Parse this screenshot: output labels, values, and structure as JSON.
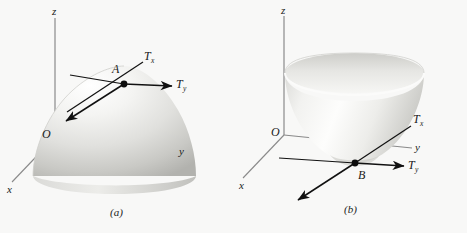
{
  "figure": {
    "background_color": "#f8f8f7",
    "ink_color": "#1a1a1a",
    "surface_light": "#fdfdfd",
    "surface_mid": "#e2e2e0",
    "surface_dark": "#b9b9b6",
    "axis_color": "#7a7a7a"
  },
  "panel_a": {
    "caption": "(a)",
    "axes": {
      "z_label": "z",
      "y_label": "y",
      "x_label": "x",
      "origin_label": "O"
    },
    "point_label": "A",
    "vectors": [
      {
        "name": "T",
        "subscript": "x",
        "label": "T",
        "sub": "x"
      },
      {
        "name": "T",
        "subscript": "y",
        "label": "T",
        "sub": "y"
      }
    ],
    "surface": "downward-opening paraboloid dome",
    "description": "Dome-shaped paraboloid with point A on its upper surface and two tangent vectors Tx and Ty drawn in the tangent plane at A."
  },
  "panel_b": {
    "caption": "(b)",
    "axes": {
      "z_label": "z",
      "y_label": "y",
      "x_label": "x",
      "origin_label": "O"
    },
    "point_label": "B",
    "vectors": [
      {
        "name": "T",
        "subscript": "x",
        "label": "T",
        "sub": "x"
      },
      {
        "name": "T",
        "subscript": "y",
        "label": "T",
        "sub": "y"
      }
    ],
    "surface": "upward-opening paraboloid bowl",
    "description": "Bowl-shaped paraboloid with point B at its bottom vertex and two tangent vectors Tx and Ty drawn in the horizontal tangent plane at B."
  }
}
